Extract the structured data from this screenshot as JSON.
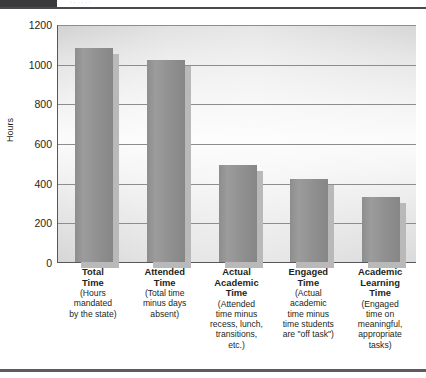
{
  "page": {
    "top_strip_ghost_text": "· · · · · ·",
    "dark_tab_name": "page-corner-tab"
  },
  "chart_data": {
    "type": "bar",
    "title": "",
    "xlabel": "",
    "ylabel": "Hours",
    "ylim": [
      0,
      1200
    ],
    "ytick_values": [
      1200,
      1000,
      800,
      600,
      400,
      200,
      0
    ],
    "ytick_labels": [
      "1200",
      "1000",
      "800",
      "600",
      "400",
      "200",
      "0"
    ],
    "grid": true,
    "grid_axis": "y",
    "legend": "none",
    "bar_color": "#909090",
    "bar_shadow_color": "#b9b9b9",
    "plot_background": "#f0f0f0",
    "axis_color": "#58585a",
    "categories": [
      "Total Time (Hours mandated by the state)",
      "Attended Time (Total time minus days absent)",
      "Actual Academic Time (Attended time minus recess, lunch, transitions, etc.)",
      "Engaged Time (Actual academic time minus time students are \"off task\")",
      "Academic Learning Time (Engaged time on meaningful, appropriate tasks)"
    ],
    "values": [
      1080,
      1020,
      490,
      420,
      330
    ],
    "category_parts": [
      {
        "title": "Total\nTime",
        "sub": "(Hours\nmandated\nby the state)"
      },
      {
        "title": "Attended\nTime",
        "sub": "(Total time\nminus days\nabsent)"
      },
      {
        "title": "Actual\nAcademic\nTime",
        "sub": "(Attended\ntime minus\nrecess, lunch,\ntransitions,\netc.)"
      },
      {
        "title": "Engaged\nTime",
        "sub": "(Actual\nacademic\ntime minus\ntime students\nare \"off task\")"
      },
      {
        "title": "Academic\nLearning\nTime",
        "sub": "(Engaged\ntime on\nmeaningful,\nappropriate\ntasks)"
      }
    ]
  }
}
